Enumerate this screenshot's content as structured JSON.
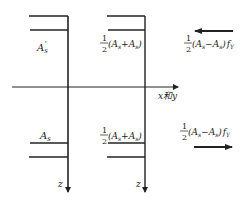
{
  "diagram": {
    "type": "structural-cross-section-force-diagram",
    "axes": {
      "horizontal_label": "x和y",
      "left_vertical_label": "z",
      "right_vertical_label": "z"
    },
    "left_section": {
      "top_label": "A's",
      "top_label_base": "A",
      "top_label_sub": "s",
      "top_label_prime": "'",
      "bottom_label": "As",
      "bottom_label_base": "A",
      "bottom_label_sub": "s"
    },
    "middle_section": {
      "top_label": "1/2(As+A's)",
      "bottom_label": "1/2(As+A's)",
      "frac_num": "1",
      "frac_den": "2",
      "expr": "(A",
      "sub_s": "s",
      "plus": "+A",
      "close": ")"
    },
    "right_forces": {
      "top_label": "1/2(As−A's)fY",
      "top_arrow_direction": "left",
      "bottom_label": "1/2(As−A's)fY",
      "bottom_arrow_direction": "right",
      "frac_num": "1",
      "frac_den": "2",
      "expr": "(A",
      "minus": "−A",
      "close": ")",
      "f": "f",
      "f_sub": "Y"
    },
    "colors": {
      "line": "#222222",
      "background": "#ffffff"
    }
  }
}
